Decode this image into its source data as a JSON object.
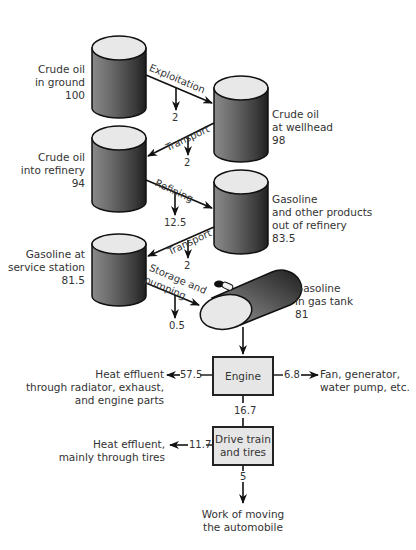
{
  "diagram": {
    "stages": [
      {
        "name": "Crude oil in ground",
        "lines": [
          "Crude oil",
          "in ground"
        ],
        "value": "100"
      },
      {
        "name": "Crude oil at wellhead",
        "lines": [
          "Crude oil",
          "at wellhead"
        ],
        "value": "98"
      },
      {
        "name": "Crude oil into refinery",
        "lines": [
          "Crude oil",
          "into refinery"
        ],
        "value": "94"
      },
      {
        "name": "Gasoline and other products out of refinery",
        "lines": [
          "Gasoline",
          "and other products",
          "out of refinery"
        ],
        "value": "83.5"
      },
      {
        "name": "Gasoline at service station",
        "lines": [
          "Gasoline at",
          "service station"
        ],
        "value": "81.5"
      },
      {
        "name": "Gasoline in gas tank",
        "lines": [
          "Gasoline",
          "in gas tank"
        ],
        "value": "81"
      }
    ],
    "transitions": [
      {
        "label": "Exploitation",
        "loss": "2"
      },
      {
        "label": "Transport",
        "loss": "2"
      },
      {
        "label": "Refining",
        "loss": "12.5"
      },
      {
        "label": "Transport",
        "loss": "2"
      },
      {
        "label_lines": [
          "Storage and",
          "pumping"
        ],
        "loss": "0.5"
      }
    ],
    "engine": {
      "label": "Engine",
      "heat_loss": "57.5",
      "heat_lines": [
        "Heat effluent",
        "through radiator, exhaust,",
        "and engine parts"
      ],
      "accessory_loss": "6.8",
      "accessory_lines": [
        "Fan, generator,",
        "water pump, etc."
      ],
      "output": "16.7"
    },
    "drive_train": {
      "label_lines": [
        "Drive train",
        "and tires"
      ],
      "heat_loss": "11.7",
      "heat_lines": [
        "Heat effluent,",
        "mainly through tires"
      ],
      "output": "5"
    },
    "final": {
      "lines": [
        "Work of moving",
        "the automobile"
      ]
    }
  }
}
